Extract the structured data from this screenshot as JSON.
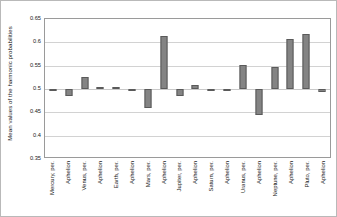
{
  "chart_data": {
    "type": "bar",
    "title": "",
    "xlabel": "",
    "ylabel": "Mean values of the harmonic probabilities",
    "ylim": [
      0.35,
      0.65
    ],
    "yticks": [
      "0.65",
      "0.6",
      "0.55",
      "0.5",
      "0.45",
      "0.4",
      "0.35"
    ],
    "ytick_values": [
      0.65,
      0.6,
      0.55,
      0.5,
      0.45,
      0.4,
      0.35
    ],
    "grid": true,
    "legend": false,
    "baseline": 0.5,
    "categories": [
      "Mercury, per.",
      "Aphelion",
      "Venus, per.",
      "Aphelion",
      "Earth, per.",
      "Aphelion",
      "Mars, per.",
      "Aphelion",
      "Jupiter, per.",
      "Aphelion",
      "Saturn, per.",
      "Aphelion",
      "Uranus, per.",
      "Aphelion",
      "Neptune, per.",
      "Aphelion",
      "Pluto, per.",
      "Aphelion"
    ],
    "values": [
      0.4995,
      0.4845,
      0.5265,
      0.5045,
      0.5045,
      0.4955,
      0.4585,
      0.6135,
      0.4855,
      0.5085,
      0.4985,
      0.4995,
      0.5505,
      0.4445,
      0.5465,
      0.6065,
      0.6175,
      0.4935
    ],
    "bar_color": "#848484",
    "bar_border_color": "#5a5a5a",
    "grid_color": "#d2d2d2",
    "plot_border_color": "#9a9a9a",
    "frame_border_color": "#b9b9b9",
    "text_color": "#1b1b1b"
  }
}
